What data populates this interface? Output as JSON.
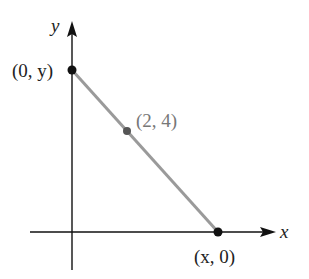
{
  "diagram": {
    "axes": {
      "x_label": "x",
      "y_label": "y"
    },
    "points": [
      {
        "label": "(0, y)",
        "role": "y-intercept"
      },
      {
        "label": "(2, 4)",
        "role": "given-point"
      },
      {
        "label": "(x, 0)",
        "role": "x-intercept"
      }
    ],
    "colors": {
      "axis": "#111111",
      "segment": "#9a9a9a",
      "point": "#111111",
      "mid_point": "#555555",
      "mid_label": "#777777"
    }
  }
}
